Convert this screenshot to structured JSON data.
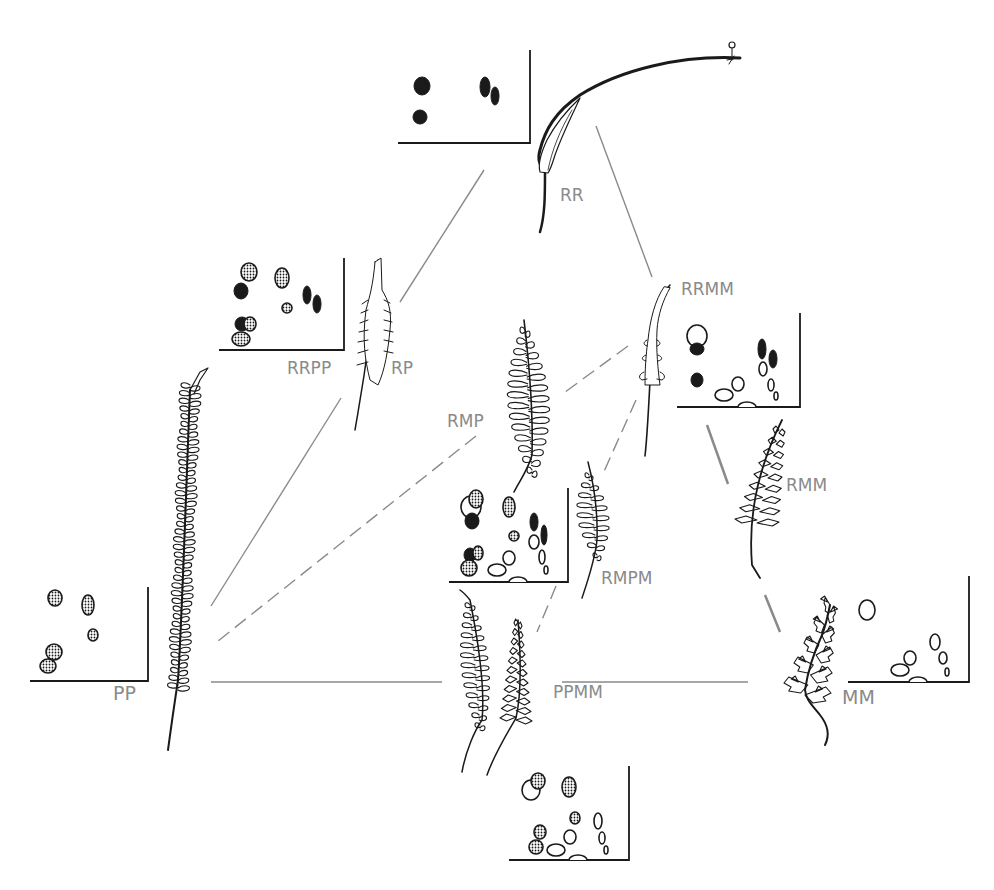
{
  "diagram": {
    "title": "",
    "colors": {
      "ink": "#1a1a1a",
      "connector": "#8a8a8a",
      "label": "#8a8a8a",
      "background": "#ffffff"
    },
    "nodes": [
      {
        "id": "RR",
        "label": "RR",
        "x": 560,
        "y": 197
      },
      {
        "id": "RP",
        "label": "RP",
        "x": 391,
        "y": 370
      },
      {
        "id": "RRPP",
        "label": "RRPP",
        "x": 287,
        "y": 370
      },
      {
        "id": "RRMM",
        "label": "RRMM",
        "x": 681,
        "y": 291
      },
      {
        "id": "RMP",
        "label": "RMP",
        "x": 447,
        "y": 423
      },
      {
        "id": "RMM",
        "label": "RMM",
        "x": 786,
        "y": 487
      },
      {
        "id": "RMPM",
        "label": "RMPM",
        "x": 601,
        "y": 580
      },
      {
        "id": "PP",
        "label": "PP",
        "x": 113,
        "y": 694
      },
      {
        "id": "PPMM",
        "label": "PPMM",
        "x": 553,
        "y": 694
      },
      {
        "id": "MM",
        "label": "MM",
        "x": 842,
        "y": 698
      }
    ],
    "connectors": [
      {
        "from": "RR-chart",
        "to": "RRPP",
        "style": "solid",
        "x1": 484,
        "y1": 170,
        "x2": 400,
        "y2": 302
      },
      {
        "from": "RR",
        "to": "RRMM",
        "style": "solid",
        "x1": 596,
        "y1": 126,
        "x2": 652,
        "y2": 277
      },
      {
        "from": "RRPP",
        "to": "PP",
        "style": "solid",
        "x1": 341,
        "y1": 398,
        "x2": 211,
        "y2": 606
      },
      {
        "from": "RMP",
        "to": "PP",
        "style": "dashed",
        "x1": 476,
        "y1": 436,
        "x2": 213,
        "y2": 645
      },
      {
        "from": "PPMM",
        "to": "PP",
        "style": "solid",
        "x1": 442,
        "y1": 682,
        "x2": 211,
        "y2": 682
      },
      {
        "from": "RRMM",
        "to": "RMP",
        "style": "dashed",
        "x1": 628,
        "y1": 346,
        "x2": 561,
        "y2": 395
      },
      {
        "from": "RRMM",
        "to": "RMPM",
        "style": "dashed",
        "x1": 636,
        "y1": 400,
        "x2": 602,
        "y2": 476
      },
      {
        "from": "RMPM",
        "to": "PPMM",
        "style": "dashed",
        "x1": 556,
        "y1": 586,
        "x2": 537,
        "y2": 632
      },
      {
        "from": "RRMM",
        "to": "RMM",
        "style": "solid",
        "x1": 707,
        "y1": 425,
        "x2": 728,
        "y2": 484
      },
      {
        "from": "RMM",
        "to": "MM",
        "style": "solid",
        "x1": 765,
        "y1": 595,
        "x2": 780,
        "y2": 632
      },
      {
        "from": "MM",
        "to": "PPMM",
        "style": "solid",
        "x1": 748,
        "y1": 682,
        "x2": 562,
        "y2": 682
      }
    ],
    "spot_charts": [
      {
        "id": "chart-RR",
        "ox": 398,
        "oy": 143,
        "w": 132,
        "h": 93,
        "spots": [
          {
            "x": 422,
            "y": 86,
            "rx": 8,
            "ry": 9,
            "fill": "solid"
          },
          {
            "x": 420,
            "y": 117,
            "rx": 7,
            "ry": 7,
            "fill": "solid"
          },
          {
            "x": 485,
            "y": 87,
            "rx": 5,
            "ry": 10,
            "fill": "solid"
          },
          {
            "x": 495,
            "y": 96,
            "rx": 4,
            "ry": 9,
            "fill": "solid"
          }
        ]
      },
      {
        "id": "chart-RRPP",
        "ox": 219,
        "oy": 350,
        "w": 125,
        "h": 92,
        "spots": [
          {
            "x": 249,
            "y": 272,
            "rx": 8,
            "ry": 9,
            "fill": "dotted"
          },
          {
            "x": 241,
            "y": 291,
            "rx": 7,
            "ry": 8,
            "fill": "solid"
          },
          {
            "x": 282,
            "y": 278,
            "rx": 7,
            "ry": 10,
            "fill": "dotted"
          },
          {
            "x": 287,
            "y": 308,
            "rx": 5,
            "ry": 5,
            "fill": "dotted"
          },
          {
            "x": 307,
            "y": 295,
            "rx": 4,
            "ry": 9,
            "fill": "solid"
          },
          {
            "x": 317,
            "y": 304,
            "rx": 4,
            "ry": 9,
            "fill": "solid"
          },
          {
            "x": 242,
            "y": 324,
            "rx": 7,
            "ry": 7,
            "fill": "solid"
          },
          {
            "x": 250,
            "y": 324,
            "rx": 6,
            "ry": 7,
            "fill": "dotted"
          },
          {
            "x": 241,
            "y": 339,
            "rx": 9,
            "ry": 7,
            "fill": "dotted"
          }
        ]
      },
      {
        "id": "chart-RRMM",
        "ox": 677,
        "oy": 407,
        "w": 123,
        "h": 94,
        "spots": [
          {
            "x": 697,
            "y": 336,
            "rx": 10,
            "ry": 11,
            "fill": "open"
          },
          {
            "x": 697,
            "y": 349,
            "rx": 7,
            "ry": 6,
            "fill": "solid"
          },
          {
            "x": 697,
            "y": 380,
            "rx": 6,
            "ry": 7,
            "fill": "solid"
          },
          {
            "x": 762,
            "y": 349,
            "rx": 4,
            "ry": 10,
            "fill": "solid"
          },
          {
            "x": 773,
            "y": 359,
            "rx": 4,
            "ry": 9,
            "fill": "solid"
          },
          {
            "x": 763,
            "y": 369,
            "rx": 4,
            "ry": 7,
            "fill": "open"
          },
          {
            "x": 738,
            "y": 384,
            "rx": 6,
            "ry": 7,
            "fill": "open"
          },
          {
            "x": 724,
            "y": 395,
            "rx": 9,
            "ry": 6,
            "fill": "open"
          },
          {
            "x": 771,
            "y": 385,
            "rx": 3,
            "ry": 6,
            "fill": "open"
          },
          {
            "x": 776,
            "y": 396,
            "rx": 2,
            "ry": 4,
            "fill": "open"
          },
          {
            "x": 747,
            "y": 406,
            "rx": 9,
            "ry": 5,
            "fill": "open-half"
          }
        ]
      },
      {
        "id": "chart-RMPM",
        "ox": 449,
        "oy": 582,
        "w": 119,
        "h": 93,
        "spots": [
          {
            "x": 471,
            "y": 507,
            "rx": 10,
            "ry": 11,
            "fill": "open"
          },
          {
            "x": 476,
            "y": 499,
            "rx": 7,
            "ry": 9,
            "fill": "dotted"
          },
          {
            "x": 472,
            "y": 521,
            "rx": 7,
            "ry": 8,
            "fill": "solid"
          },
          {
            "x": 509,
            "y": 507,
            "rx": 6,
            "ry": 10,
            "fill": "dotted"
          },
          {
            "x": 534,
            "y": 522,
            "rx": 4,
            "ry": 9,
            "fill": "solid"
          },
          {
            "x": 544,
            "y": 535,
            "rx": 3,
            "ry": 10,
            "fill": "solid"
          },
          {
            "x": 514,
            "y": 536,
            "rx": 5,
            "ry": 5,
            "fill": "dotted"
          },
          {
            "x": 534,
            "y": 542,
            "rx": 5,
            "ry": 7,
            "fill": "open"
          },
          {
            "x": 470,
            "y": 555,
            "rx": 6,
            "ry": 7,
            "fill": "solid"
          },
          {
            "x": 478,
            "y": 553,
            "rx": 5,
            "ry": 7,
            "fill": "dotted"
          },
          {
            "x": 469,
            "y": 568,
            "rx": 8,
            "ry": 8,
            "fill": "dotted"
          },
          {
            "x": 509,
            "y": 558,
            "rx": 6,
            "ry": 7,
            "fill": "open"
          },
          {
            "x": 497,
            "y": 570,
            "rx": 9,
            "ry": 6,
            "fill": "open"
          },
          {
            "x": 542,
            "y": 557,
            "rx": 3,
            "ry": 7,
            "fill": "open"
          },
          {
            "x": 546,
            "y": 570,
            "rx": 2,
            "ry": 4,
            "fill": "open"
          },
          {
            "x": 518,
            "y": 581,
            "rx": 9,
            "ry": 5,
            "fill": "open-half"
          }
        ]
      },
      {
        "id": "chart-PP",
        "ox": 30,
        "oy": 681,
        "w": 118,
        "h": 94,
        "spots": [
          {
            "x": 55,
            "y": 598,
            "rx": 7,
            "ry": 8,
            "fill": "dotted"
          },
          {
            "x": 88,
            "y": 605,
            "rx": 6,
            "ry": 10,
            "fill": "dotted"
          },
          {
            "x": 93,
            "y": 635,
            "rx": 5,
            "ry": 6,
            "fill": "dotted"
          },
          {
            "x": 54,
            "y": 652,
            "rx": 8,
            "ry": 8,
            "fill": "dotted"
          },
          {
            "x": 48,
            "y": 666,
            "rx": 8,
            "ry": 7,
            "fill": "dotted"
          }
        ]
      },
      {
        "id": "chart-MM",
        "ox": 848,
        "oy": 682,
        "w": 121,
        "h": 106,
        "spots": [
          {
            "x": 867,
            "y": 610,
            "rx": 8,
            "ry": 10,
            "fill": "open"
          },
          {
            "x": 935,
            "y": 642,
            "rx": 5,
            "ry": 8,
            "fill": "open"
          },
          {
            "x": 943,
            "y": 658,
            "rx": 4,
            "ry": 6,
            "fill": "open"
          },
          {
            "x": 910,
            "y": 658,
            "rx": 6,
            "ry": 7,
            "fill": "open"
          },
          {
            "x": 900,
            "y": 670,
            "rx": 9,
            "ry": 6,
            "fill": "open"
          },
          {
            "x": 947,
            "y": 672,
            "rx": 2,
            "ry": 4,
            "fill": "open"
          },
          {
            "x": 918,
            "y": 681,
            "rx": 9,
            "ry": 5,
            "fill": "open-half"
          }
        ]
      },
      {
        "id": "chart-PPMM",
        "ox": 509,
        "oy": 860,
        "w": 120,
        "h": 94,
        "spots": [
          {
            "x": 531,
            "y": 790,
            "rx": 9,
            "ry": 10,
            "fill": "open"
          },
          {
            "x": 538,
            "y": 781,
            "rx": 7,
            "ry": 8,
            "fill": "dotted"
          },
          {
            "x": 569,
            "y": 787,
            "rx": 7,
            "ry": 10,
            "fill": "dotted"
          },
          {
            "x": 575,
            "y": 818,
            "rx": 5,
            "ry": 6,
            "fill": "dotted"
          },
          {
            "x": 598,
            "y": 821,
            "rx": 4,
            "ry": 8,
            "fill": "open"
          },
          {
            "x": 602,
            "y": 838,
            "rx": 3,
            "ry": 6,
            "fill": "open"
          },
          {
            "x": 540,
            "y": 832,
            "rx": 6,
            "ry": 7,
            "fill": "dotted"
          },
          {
            "x": 536,
            "y": 847,
            "rx": 7,
            "ry": 7,
            "fill": "dotted"
          },
          {
            "x": 570,
            "y": 837,
            "rx": 6,
            "ry": 7,
            "fill": "open"
          },
          {
            "x": 556,
            "y": 850,
            "rx": 9,
            "ry": 6,
            "fill": "open"
          },
          {
            "x": 606,
            "y": 850,
            "rx": 2,
            "ry": 4,
            "fill": "open"
          },
          {
            "x": 578,
            "y": 860,
            "rx": 9,
            "ry": 5,
            "fill": "open-half"
          }
        ]
      }
    ],
    "fronds": [
      {
        "id": "frond-RR",
        "description": "simple undivided frond with long whip-like tip"
      },
      {
        "id": "frond-RP",
        "description": "narrow pinnatifid frond"
      },
      {
        "id": "frond-PP",
        "description": "long narrow pinnate frond with many short pinnae"
      },
      {
        "id": "frond-RRMM",
        "description": "narrow frond with lobed base"
      },
      {
        "id": "frond-RMP",
        "description": "pinnate frond with elongated pinnae"
      },
      {
        "id": "frond-RMM",
        "description": "lobed pinnate frond"
      },
      {
        "id": "frond-RMPM",
        "description": "small pinnate frond"
      },
      {
        "id": "frond-PPMM",
        "description": "pair of pinnate fronds"
      },
      {
        "id": "frond-MM",
        "description": "bipinnate finely divided frond"
      }
    ]
  }
}
